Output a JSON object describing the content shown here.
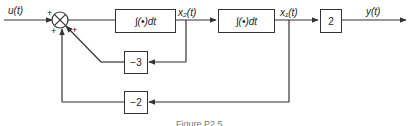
{
  "diagram": {
    "signals": {
      "input": "u(t)",
      "x2": "x₂(t)",
      "x1": "x₁(t)",
      "output": "y(t)"
    },
    "summing_junction": {
      "signs": {
        "left": "+",
        "bottom_left": "+",
        "right": "+"
      }
    },
    "blocks": {
      "integrator1": "∫(•)dt",
      "integrator2": "∫(•)dt",
      "gain_out": "2",
      "feedback_x2": "−3",
      "feedback_x1": "−2"
    },
    "caption": "Figure P2.5"
  }
}
